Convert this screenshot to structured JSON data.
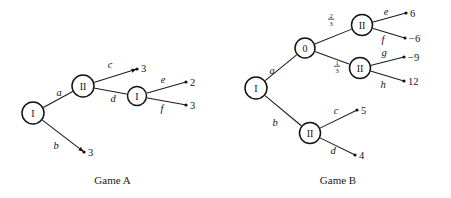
{
  "figure": {
    "width": 451,
    "height": 198,
    "background": "#ffffff",
    "ink_color": "#141414"
  },
  "games": [
    {
      "id": "game-a",
      "caption": "Game A",
      "nodes": [
        {
          "id": "a-root",
          "label": "I",
          "kind": "player",
          "x": 33,
          "y": 113,
          "r": 11
        },
        {
          "id": "a-n2",
          "label": "II",
          "kind": "player",
          "x": 83,
          "y": 86,
          "r": 11
        },
        {
          "id": "a-n3",
          "label": "I",
          "kind": "player",
          "x": 137,
          "y": 96,
          "r": 9.5
        }
      ],
      "terminals": [
        {
          "id": "a-t-c",
          "value": "3",
          "x": 137,
          "y": 69,
          "label_dx": 4,
          "label_dy": -0.5,
          "arrow": true
        },
        {
          "id": "a-t-b",
          "value": "3",
          "x": 84,
          "y": 152,
          "label_dx": 4,
          "label_dy": 0,
          "arrow": true
        },
        {
          "id": "a-t-e",
          "value": "2",
          "x": 186,
          "y": 82,
          "label_dx": 4,
          "label_dy": 0,
          "arrow": false
        },
        {
          "id": "a-t-f",
          "value": "3",
          "x": 186,
          "y": 105,
          "label_dx": 4,
          "label_dy": 0,
          "arrow": false
        }
      ],
      "edges": [
        {
          "id": "a-e-a",
          "from": "a-root",
          "to": "a-n2",
          "action": "a",
          "lx": 59,
          "ly": 92
        },
        {
          "id": "a-e-b",
          "from": "a-root",
          "to": "a-t-b",
          "action": "b",
          "lx": 56,
          "ly": 145
        },
        {
          "id": "a-e-c",
          "from": "a-n2",
          "to": "a-t-c",
          "action": "c",
          "lx": 110,
          "ly": 64
        },
        {
          "id": "a-e-d",
          "from": "a-n2",
          "to": "a-n3",
          "action": "d",
          "lx": 113,
          "ly": 98
        },
        {
          "id": "a-e-e",
          "from": "a-n3",
          "to": "a-t-e",
          "action": "e",
          "lx": 163,
          "ly": 79
        },
        {
          "id": "a-e-f",
          "from": "a-n3",
          "to": "a-t-f",
          "action": "f",
          "lx": 162,
          "ly": 108
        }
      ]
    },
    {
      "id": "game-b",
      "caption": "Game B",
      "nodes": [
        {
          "id": "b-root",
          "label": "I",
          "kind": "player",
          "x": 256,
          "y": 88,
          "r": 11
        },
        {
          "id": "b-ch",
          "label": "0",
          "kind": "chance",
          "x": 305,
          "y": 48,
          "r": 10
        },
        {
          "id": "b-n-up",
          "label": "II",
          "kind": "player",
          "x": 362,
          "y": 25,
          "r": 10.5
        },
        {
          "id": "b-n-md",
          "label": "II",
          "kind": "player",
          "x": 360,
          "y": 68,
          "r": 10.5
        },
        {
          "id": "b-n-lo",
          "label": "II",
          "kind": "player",
          "x": 310,
          "y": 133,
          "r": 10.5
        }
      ],
      "terminals": [
        {
          "id": "b-t-e",
          "value": "6",
          "x": 406,
          "y": 13,
          "label_dx": 4,
          "label_dy": 0,
          "arrow": false
        },
        {
          "id": "b-t-f",
          "value": "−6",
          "x": 405,
          "y": 38,
          "label_dx": 4,
          "label_dy": 0,
          "arrow": false
        },
        {
          "id": "b-t-g",
          "value": "−9",
          "x": 404,
          "y": 57,
          "label_dx": 4,
          "label_dy": 0,
          "arrow": false
        },
        {
          "id": "b-t-h",
          "value": "12",
          "x": 404,
          "y": 81,
          "label_dx": 4,
          "label_dy": 0,
          "arrow": false
        },
        {
          "id": "b-t-c",
          "value": "5",
          "x": 357,
          "y": 110,
          "label_dx": 4,
          "label_dy": 0,
          "arrow": false
        },
        {
          "id": "b-t-d",
          "value": "4",
          "x": 355,
          "y": 155,
          "label_dx": 4,
          "label_dy": 0,
          "arrow": false
        }
      ],
      "edges": [
        {
          "id": "b-e-a",
          "from": "b-root",
          "to": "b-ch",
          "action": "a",
          "lx": 272,
          "ly": 70
        },
        {
          "id": "b-e-b",
          "from": "b-root",
          "to": "b-n-lo",
          "action": "b",
          "lx": 275,
          "ly": 122
        },
        {
          "id": "b-e-p1",
          "from": "b-ch",
          "to": "b-n-up",
          "action": "",
          "lx": 0,
          "ly": 0,
          "prob": {
            "num": "2",
            "den": "3",
            "x": 331,
            "y": 19
          }
        },
        {
          "id": "b-e-p2",
          "from": "b-ch",
          "to": "b-n-md",
          "action": "",
          "lx": 0,
          "ly": 0,
          "prob": {
            "num": "1",
            "den": "3",
            "x": 337,
            "y": 66
          }
        },
        {
          "id": "b-e-e",
          "from": "b-n-up",
          "to": "b-t-e",
          "action": "e",
          "lx": 386,
          "ly": 11
        },
        {
          "id": "b-e-f",
          "from": "b-n-up",
          "to": "b-t-f",
          "action": "f",
          "lx": 383,
          "ly": 39
        },
        {
          "id": "b-e-g",
          "from": "b-n-md",
          "to": "b-t-g",
          "action": "g",
          "lx": 384,
          "ly": 52
        },
        {
          "id": "b-e-h",
          "from": "b-n-md",
          "to": "b-t-h",
          "action": "h",
          "lx": 383,
          "ly": 84
        },
        {
          "id": "b-e-c",
          "from": "b-n-lo",
          "to": "b-t-c",
          "action": "c",
          "lx": 336,
          "ly": 110
        },
        {
          "id": "b-e-d",
          "from": "b-n-lo",
          "to": "b-t-d",
          "action": "d",
          "lx": 333,
          "ly": 150
        }
      ]
    }
  ]
}
